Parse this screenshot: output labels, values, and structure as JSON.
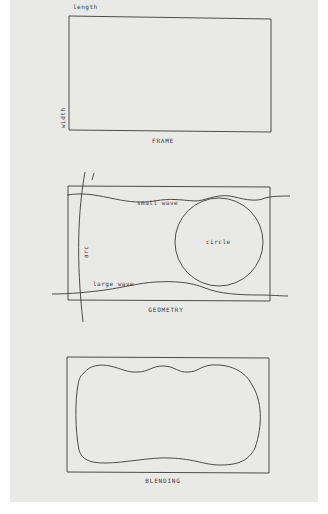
{
  "panels": [
    {
      "id": "frame",
      "caption": "FRAME",
      "labels": {
        "top": "length",
        "side": "width"
      }
    },
    {
      "id": "geometry",
      "caption": "GEOMETRY",
      "labels": {
        "small_wave": "small wave",
        "large_wave": "large wave",
        "circle": "circle",
        "arc": "arc",
        "line_tick": "l"
      }
    },
    {
      "id": "blending",
      "caption": "BLENDING"
    }
  ],
  "colors": {
    "paper": "#e9e9e7",
    "ink": "#3a3a3a",
    "border": "#ffffff"
  }
}
